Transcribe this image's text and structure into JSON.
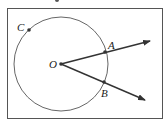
{
  "diagram": {
    "type": "geometry",
    "frame": {
      "x": 7,
      "y": 8,
      "width": 156,
      "height": 111,
      "stroke": "#555555"
    },
    "circle": {
      "center_label": "O",
      "cx": 61,
      "cy": 64,
      "r": 47,
      "stroke": "#666666"
    },
    "points": [
      {
        "label": "O",
        "x": 61,
        "y": 64,
        "label_x": 49,
        "label_y": 68
      },
      {
        "label": "A",
        "x": 105,
        "y": 52,
        "label_x": 108,
        "label_y": 49
      },
      {
        "label": "B",
        "x": 104,
        "y": 82,
        "label_x": 101,
        "label_y": 97
      },
      {
        "label": "C",
        "x": 29,
        "y": 30,
        "label_x": 17,
        "label_y": 31
      }
    ],
    "rays": [
      {
        "name": "ray-OA",
        "from": "O",
        "through": "A",
        "x1": 61,
        "y1": 64,
        "x2": 150,
        "y2": 41
      },
      {
        "name": "ray-OB",
        "from": "O",
        "through": "B",
        "x1": 61,
        "y1": 64,
        "x2": 145,
        "y2": 100
      }
    ],
    "colors": {
      "line": "#333333",
      "point": "#333333",
      "circle": "#666666",
      "frame": "#555555"
    }
  }
}
